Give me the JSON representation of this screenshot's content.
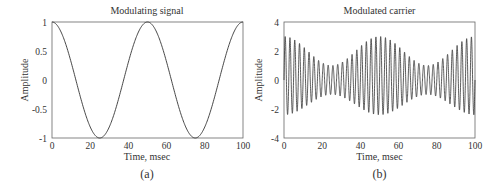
{
  "chart_data": [
    {
      "type": "line",
      "panel_label": "(a)",
      "title": "Modulating signal",
      "xlabel": "Time, msec",
      "ylabel": "Amplitude",
      "xlim": [
        0,
        100
      ],
      "ylim": [
        -1,
        1
      ],
      "xticks": [
        0,
        20,
        40,
        60,
        80,
        100
      ],
      "yticks": [
        -1,
        -0.5,
        0,
        0.5,
        1
      ],
      "ytick_labels": [
        "-1",
        "-0.5",
        "0",
        "0.5",
        "1"
      ],
      "grid": false,
      "series": [
        {
          "name": "modulating",
          "function": "cos(2*pi*20*t)",
          "frequency_hz": 20,
          "x": [
            0,
            12.5,
            25,
            37.5,
            50,
            62.5,
            75,
            87.5,
            100
          ],
          "values": [
            1,
            0,
            -1,
            0,
            1,
            0,
            -1,
            0,
            1
          ]
        }
      ]
    },
    {
      "type": "line",
      "panel_label": "(b)",
      "title": "Modulated carrier",
      "xlabel": "Time, msec",
      "ylabel": "Amplitude",
      "xlim": [
        0,
        100
      ],
      "ylim": [
        -4,
        4
      ],
      "xticks": [
        0,
        20,
        40,
        60,
        80,
        100
      ],
      "yticks": [
        -4,
        -2,
        0,
        2,
        4
      ],
      "ytick_labels": [
        "-4",
        "-2",
        "0",
        "2",
        "4"
      ],
      "grid": false,
      "series": [
        {
          "name": "modulated carrier",
          "carrier_hz": 400,
          "envelope_max": 3,
          "envelope_min_peak": 1,
          "x": [
            0,
            25,
            50,
            75,
            100
          ],
          "upper_envelope": [
            3,
            1,
            3,
            1,
            3
          ],
          "lower_envelope": [
            -2.4,
            -1,
            -2.4,
            -1,
            -2.4
          ]
        }
      ]
    }
  ],
  "panels": [
    {
      "title": "Modulating signal",
      "xlabel": "Time, msec",
      "ylabel": "Amplitude",
      "caption": "(a)",
      "xticks": [
        "0",
        "20",
        "40",
        "60",
        "80",
        "100"
      ],
      "yticks": [
        "1",
        "0.5",
        "0",
        "-0.5",
        "-1"
      ]
    },
    {
      "title": "Modulated carrier",
      "xlabel": "Time, msec",
      "ylabel": "Amplitude",
      "caption": "(b)",
      "xticks": [
        "0",
        "20",
        "40",
        "60",
        "80",
        "100"
      ],
      "yticks": [
        "4",
        "2",
        "0",
        "-2",
        "-4"
      ]
    }
  ],
  "colors": {
    "line": "#333333",
    "axes": "#555555",
    "background": "#ffffff"
  }
}
